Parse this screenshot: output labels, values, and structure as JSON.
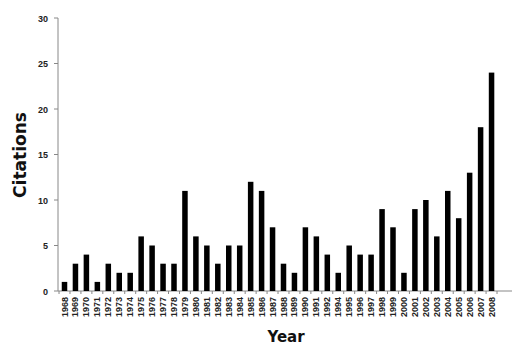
{
  "chart_data": {
    "type": "bar",
    "title": "",
    "xlabel": "Year",
    "ylabel": "Citations",
    "ylim": [
      0,
      30
    ],
    "yticks": [
      0,
      5,
      10,
      15,
      20,
      25,
      30
    ],
    "grid": false,
    "legend": null,
    "bar_color": "#000000",
    "categories": [
      "1968",
      "1969",
      "1970",
      "1971",
      "1972",
      "1973",
      "1974",
      "1975",
      "1976",
      "1977",
      "1978",
      "1979",
      "1980",
      "1981",
      "1982",
      "1983",
      "1984",
      "1985",
      "1986",
      "1987",
      "1988",
      "1989",
      "1990",
      "1991",
      "1992",
      "1994",
      "1995",
      "1996",
      "1997",
      "1998",
      "1999",
      "2000",
      "2001",
      "2002",
      "2003",
      "2004",
      "2005",
      "2006",
      "2007",
      "2008"
    ],
    "values": [
      1,
      3,
      4,
      1,
      3,
      2,
      2,
      6,
      5,
      3,
      3,
      11,
      6,
      5,
      3,
      5,
      5,
      12,
      11,
      7,
      3,
      2,
      7,
      6,
      4,
      2,
      5,
      4,
      4,
      9,
      7,
      2,
      9,
      10,
      6,
      11,
      8,
      13,
      18,
      24
    ]
  }
}
